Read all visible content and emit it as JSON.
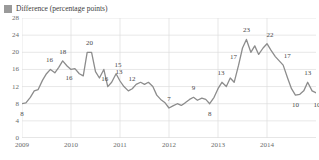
{
  "legend": {
    "swatch_color": "#9a9a9a",
    "label": "Difference (percentage points)"
  },
  "chart_data": {
    "type": "line",
    "title": "",
    "subtitle": "",
    "xlabel": "",
    "ylabel": "",
    "legend_position": "top-left",
    "grid": true,
    "line_color": "#8c8c8c",
    "ylim": [
      0,
      28
    ],
    "yticks": [
      0,
      4,
      8,
      12,
      16,
      20,
      24,
      28
    ],
    "ytick_labels": [
      "0",
      "4",
      "8",
      "12",
      "16",
      "20",
      "24",
      "28"
    ],
    "xlim": [
      2009.0,
      2015.0
    ],
    "xticks": [
      2009,
      2010,
      2011,
      2012,
      2013,
      2014
    ],
    "xtick_labels": [
      "2009",
      "2010",
      "2011",
      "2012",
      "2013",
      "2014"
    ],
    "series": [
      {
        "name": "Difference (percentage points)",
        "x": [
          2009.0,
          2009.08,
          2009.17,
          2009.25,
          2009.33,
          2009.42,
          2009.5,
          2009.58,
          2009.67,
          2009.75,
          2009.83,
          2009.92,
          2010.0,
          2010.08,
          2010.17,
          2010.25,
          2010.33,
          2010.42,
          2010.5,
          2010.58,
          2010.67,
          2010.75,
          2010.83,
          2010.92,
          2011.0,
          2011.08,
          2011.17,
          2011.25,
          2011.33,
          2011.42,
          2011.5,
          2011.58,
          2011.67,
          2011.75,
          2011.83,
          2011.92,
          2012.0,
          2012.08,
          2012.17,
          2012.25,
          2012.33,
          2012.42,
          2012.5,
          2012.58,
          2012.67,
          2012.75,
          2012.83,
          2012.92,
          2013.0,
          2013.08,
          2013.17,
          2013.25,
          2013.33,
          2013.42,
          2013.5,
          2013.58,
          2013.67,
          2013.75,
          2013.83,
          2013.92,
          2014.0,
          2014.08,
          2014.17,
          2014.25,
          2014.33,
          2014.42,
          2014.5,
          2014.58,
          2014.67,
          2014.75,
          2014.83,
          2014.92
        ],
        "values": [
          8.0,
          8.2,
          9.5,
          11.0,
          11.3,
          13.5,
          15.0,
          16.0,
          15.2,
          16.5,
          18.0,
          16.8,
          16.0,
          16.2,
          15.0,
          14.5,
          20.0,
          20.0,
          15.5,
          14.0,
          16.0,
          12.0,
          13.0,
          15.0,
          13.3,
          12.0,
          11.0,
          11.5,
          12.5,
          13.0,
          12.5,
          13.0,
          12.0,
          10.0,
          9.0,
          8.2,
          7.0,
          7.5,
          8.0,
          7.6,
          8.2,
          9.0,
          9.5,
          8.8,
          9.3,
          9.0,
          8.0,
          9.5,
          11.5,
          13.0,
          12.0,
          14.0,
          13.0,
          17.0,
          21.0,
          23.0,
          20.0,
          21.5,
          19.5,
          21.0,
          22.0,
          20.5,
          19.0,
          18.0,
          17.0,
          14.0,
          11.5,
          10.0,
          10.2,
          11.0,
          13.0,
          11.0
        ],
        "end_values": [
          10.5,
          10.0
        ]
      }
    ],
    "annotations": [
      {
        "label": "8",
        "x": 2009.0,
        "y": 8.0,
        "dx": 0,
        "dy": 10
      },
      {
        "label": "16",
        "x": 2009.58,
        "y": 16.0,
        "dx": -1,
        "dy": -9
      },
      {
        "label": "18",
        "x": 2009.83,
        "y": 18.0,
        "dx": 0,
        "dy": -9
      },
      {
        "label": "16",
        "x": 2010.0,
        "y": 16.0,
        "dx": -2,
        "dy": 9
      },
      {
        "label": "20",
        "x": 2010.38,
        "y": 20.0,
        "dx": 0,
        "dy": -9
      },
      {
        "label": "16",
        "x": 2010.67,
        "y": 16.0,
        "dx": 1,
        "dy": 10
      },
      {
        "label": "15",
        "x": 2010.92,
        "y": 15.0,
        "dx": 2,
        "dy": -9
      },
      {
        "label": "13",
        "x": 2011.0,
        "y": 13.3,
        "dx": -1,
        "dy": -9
      },
      {
        "label": "12",
        "x": 2011.08,
        "y": 12.0,
        "dx": 8,
        "dy": -8
      },
      {
        "label": "7",
        "x": 2012.0,
        "y": 7.0,
        "dx": 0,
        "dy": -9
      },
      {
        "label": "9",
        "x": 2012.5,
        "y": 9.5,
        "dx": 0,
        "dy": -9
      },
      {
        "label": "8",
        "x": 2012.83,
        "y": 8.0,
        "dx": 0,
        "dy": 10
      },
      {
        "label": "13",
        "x": 2013.08,
        "y": 13.0,
        "dx": -1,
        "dy": -9
      },
      {
        "label": "17",
        "x": 2013.42,
        "y": 17.0,
        "dx": -5,
        "dy": -8
      },
      {
        "label": "23",
        "x": 2013.58,
        "y": 23.0,
        "dx": 0,
        "dy": -9
      },
      {
        "label": "22",
        "x": 2014.0,
        "y": 22.0,
        "dx": 3,
        "dy": -9
      },
      {
        "label": "17",
        "x": 2014.33,
        "y": 17.0,
        "dx": 4,
        "dy": -9
      },
      {
        "label": "10",
        "x": 2014.58,
        "y": 10.0,
        "dx": 0,
        "dy": 10
      },
      {
        "label": "13",
        "x": 2014.83,
        "y": 13.0,
        "dx": 0,
        "dy": -9
      },
      {
        "label": "10",
        "x": 2014.98,
        "y": 10.0,
        "dx": 2,
        "dy": 10
      }
    ]
  }
}
